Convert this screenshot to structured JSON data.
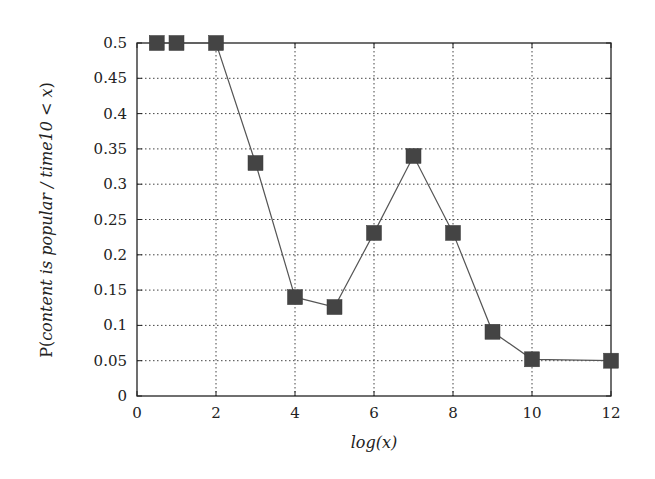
{
  "chart_data": {
    "type": "line",
    "title": "",
    "xlabel": "log(x)",
    "ylabel": "P(content is popular / time10 < x)",
    "ylabel_parts": {
      "prefix": "P(",
      "italic": "content is popular / time10 < x",
      "suffix": ")"
    },
    "xlim": [
      0,
      12
    ],
    "ylim": [
      0,
      0.5
    ],
    "xticks": [
      0,
      2,
      4,
      6,
      8,
      10,
      12
    ],
    "yticks": [
      0,
      0.05,
      0.1,
      0.15,
      0.2,
      0.25,
      0.3,
      0.35,
      0.4,
      0.45,
      0.5
    ],
    "ytick_labels": [
      "0",
      "0.05",
      "0.1",
      "0.15",
      "0.2",
      "0.25",
      "0.3",
      "0.35",
      "0.4",
      "0.45",
      "0.5"
    ],
    "xtick_labels": [
      "0",
      "2",
      "4",
      "6",
      "8",
      "10",
      "12"
    ],
    "grid": true,
    "legend": null,
    "series": [
      {
        "name": "P(content is popular)",
        "marker": "square",
        "color": "#444444",
        "x": [
          0.5,
          1,
          2,
          3,
          4,
          5,
          6,
          7,
          8,
          9,
          10,
          12
        ],
        "values": [
          0.5,
          0.5,
          0.5,
          0.33,
          0.14,
          0.126,
          0.231,
          0.34,
          0.231,
          0.091,
          0.052,
          0.05
        ]
      }
    ]
  }
}
